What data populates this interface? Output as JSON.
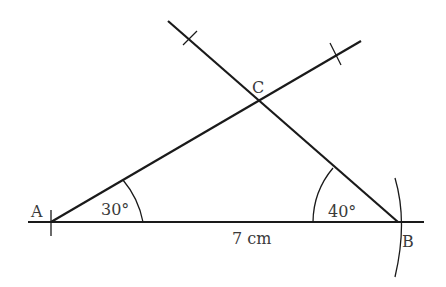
{
  "diagram": {
    "points": {
      "A": {
        "label": "A",
        "x": 51,
        "y": 222
      },
      "B": {
        "label": "B",
        "x": 398,
        "y": 222
      },
      "C": {
        "label": "C",
        "x": 259,
        "y": 100
      }
    },
    "angles": {
      "A": "30°",
      "B": "40°"
    },
    "base_length": "7 cm",
    "colors": {
      "line": "#1a1a1a",
      "text": "#3a3a3a"
    }
  }
}
